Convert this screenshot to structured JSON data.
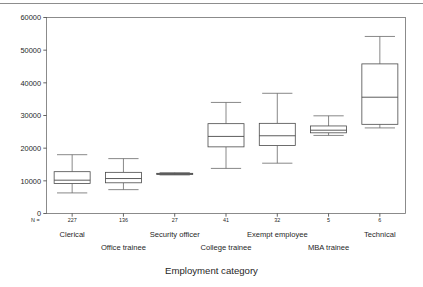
{
  "figure": {
    "axis_title": "Employment category",
    "n_prefix": "N =",
    "ytick_labels": [
      "60000",
      "50000",
      "40000",
      "30000",
      "20000",
      "10000",
      "0"
    ]
  },
  "chart_data": {
    "type": "box",
    "title": "",
    "xlabel": "Employment category",
    "ylabel": "",
    "ylim": [
      0,
      60000
    ],
    "yticks": [
      0,
      10000,
      20000,
      30000,
      40000,
      50000,
      60000
    ],
    "grid": false,
    "legend": "none",
    "categories": [
      "Clerical",
      "Office trainee",
      "Security officer",
      "College trainee",
      "Exempt employee",
      "MBA trainee",
      "Technical"
    ],
    "counts": [
      227,
      136,
      27,
      41,
      32,
      5,
      6
    ],
    "count_labels": [
      "227",
      "136",
      "27",
      "41",
      "32",
      "5",
      "6"
    ],
    "boxes": [
      {
        "category": "Clerical",
        "whisker_low": 6300,
        "q1": 9200,
        "median": 10200,
        "q3": 12800,
        "whisker_high": 18000
      },
      {
        "category": "Office trainee",
        "whisker_low": 7300,
        "q1": 9400,
        "median": 10700,
        "q3": 12600,
        "whisker_high": 16800
      },
      {
        "category": "Security officer",
        "whisker_low": 11800,
        "q1": 12000,
        "median": 12150,
        "q3": 12300,
        "whisker_high": 12500
      },
      {
        "category": "College trainee",
        "whisker_low": 13800,
        "q1": 20400,
        "median": 23600,
        "q3": 27500,
        "whisker_high": 34000
      },
      {
        "category": "Exempt employee",
        "whisker_low": 15400,
        "q1": 20800,
        "median": 23800,
        "q3": 27600,
        "whisker_high": 36800
      },
      {
        "category": "MBA trainee",
        "whisker_low": 23900,
        "q1": 24700,
        "median": 25500,
        "q3": 26800,
        "whisker_high": 29900
      },
      {
        "category": "Technical",
        "whisker_low": 26200,
        "q1": 27300,
        "median": 35600,
        "q3": 45800,
        "whisker_high": 54200
      }
    ]
  }
}
